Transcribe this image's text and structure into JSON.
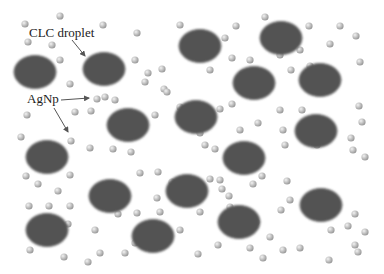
{
  "diagram": {
    "labels": {
      "droplet": "CLC droplet",
      "nanoparticle": "AgNp"
    },
    "colors": {
      "droplet_fill": "#525252",
      "droplet_edge": "#6a6a6a",
      "particle_light": "#f2f2f2",
      "particle_dark": "#9a9a9a",
      "arrow": "#555555",
      "background": "#ffffff"
    },
    "droplets": [
      {
        "cx": 35,
        "cy": 72
      },
      {
        "cx": 104,
        "cy": 69
      },
      {
        "cx": 200,
        "cy": 46
      },
      {
        "cx": 281,
        "cy": 38
      },
      {
        "cx": 254,
        "cy": 83
      },
      {
        "cx": 320,
        "cy": 80
      },
      {
        "cx": 128,
        "cy": 125
      },
      {
        "cx": 196,
        "cy": 117
      },
      {
        "cx": 316,
        "cy": 131
      },
      {
        "cx": 47,
        "cy": 157
      },
      {
        "cx": 244,
        "cy": 158
      },
      {
        "cx": 110,
        "cy": 196
      },
      {
        "cx": 187,
        "cy": 191
      },
      {
        "cx": 321,
        "cy": 205
      },
      {
        "cx": 47,
        "cy": 230
      },
      {
        "cx": 153,
        "cy": 236
      },
      {
        "cx": 239,
        "cy": 222
      }
    ],
    "particles": [
      [
        60,
        16
      ],
      [
        25,
        24
      ],
      [
        103,
        25
      ],
      [
        28,
        42
      ],
      [
        52,
        45
      ],
      [
        137,
        33
      ],
      [
        180,
        25
      ],
      [
        236,
        26
      ],
      [
        265,
        17
      ],
      [
        309,
        26
      ],
      [
        340,
        26
      ],
      [
        356,
        36
      ],
      [
        60,
        60
      ],
      [
        135,
        60
      ],
      [
        330,
        44
      ],
      [
        225,
        38
      ],
      [
        232,
        58
      ],
      [
        250,
        60
      ],
      [
        280,
        55
      ],
      [
        300,
        50
      ],
      [
        360,
        62
      ],
      [
        310,
        66
      ],
      [
        291,
        70
      ],
      [
        148,
        73
      ],
      [
        164,
        89
      ],
      [
        162,
        69
      ],
      [
        210,
        70
      ],
      [
        243,
        73
      ],
      [
        70,
        84
      ],
      [
        105,
        97
      ],
      [
        97,
        99
      ],
      [
        115,
        100
      ],
      [
        145,
        82
      ],
      [
        167,
        92
      ],
      [
        27,
        115
      ],
      [
        21,
        137
      ],
      [
        75,
        112
      ],
      [
        91,
        111
      ],
      [
        71,
        141
      ],
      [
        90,
        148
      ],
      [
        113,
        149
      ],
      [
        131,
        152
      ],
      [
        155,
        115
      ],
      [
        180,
        107
      ],
      [
        220,
        109
      ],
      [
        232,
        104
      ],
      [
        280,
        110
      ],
      [
        283,
        130
      ],
      [
        302,
        110
      ],
      [
        359,
        106
      ],
      [
        362,
        122
      ],
      [
        351,
        138
      ],
      [
        200,
        133
      ],
      [
        240,
        130
      ],
      [
        258,
        123
      ],
      [
        205,
        145
      ],
      [
        215,
        149
      ],
      [
        285,
        145
      ],
      [
        317,
        145
      ],
      [
        353,
        150
      ],
      [
        365,
        157
      ],
      [
        26,
        176
      ],
      [
        38,
        184
      ],
      [
        58,
        191
      ],
      [
        70,
        175
      ],
      [
        29,
        206
      ],
      [
        49,
        206
      ],
      [
        70,
        206
      ],
      [
        68,
        224
      ],
      [
        140,
        173
      ],
      [
        158,
        172
      ],
      [
        172,
        182
      ],
      [
        210,
        179
      ],
      [
        220,
        180
      ],
      [
        222,
        189
      ],
      [
        253,
        184
      ],
      [
        262,
        176
      ],
      [
        287,
        181
      ],
      [
        290,
        200
      ],
      [
        281,
        210
      ],
      [
        230,
        207
      ],
      [
        218,
        245
      ],
      [
        256,
        222
      ],
      [
        270,
        237
      ],
      [
        348,
        226
      ],
      [
        331,
        230
      ],
      [
        355,
        214
      ],
      [
        355,
        245
      ],
      [
        30,
        250
      ],
      [
        64,
        257
      ],
      [
        95,
        230
      ],
      [
        100,
        253
      ],
      [
        88,
        262
      ],
      [
        125,
        253
      ],
      [
        135,
        243
      ],
      [
        180,
        230
      ],
      [
        198,
        254
      ],
      [
        250,
        248
      ],
      [
        283,
        250
      ],
      [
        263,
        258
      ],
      [
        329,
        260
      ],
      [
        358,
        252
      ],
      [
        365,
        232
      ],
      [
        157,
        198
      ],
      [
        137,
        213
      ],
      [
        118,
        214
      ],
      [
        160,
        212
      ],
      [
        200,
        212
      ],
      [
        229,
        196
      ],
      [
        300,
        248
      ]
    ],
    "arrows": [
      {
        "x1": 72,
        "y1": 40,
        "x2": 85,
        "y2": 56
      },
      {
        "x1": 61,
        "y1": 100,
        "x2": 89,
        "y2": 98
      },
      {
        "x1": 54,
        "y1": 108,
        "x2": 68,
        "y2": 132
      }
    ]
  }
}
